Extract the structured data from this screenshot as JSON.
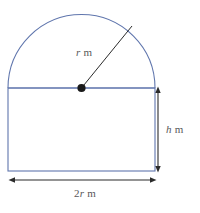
{
  "figure": {
    "name": "semicircle-on-rectangle-diagram",
    "background_color": "#ffffff",
    "outline_color": "#6076ad",
    "annotation_color": "#3a3a3a",
    "label_color": "#58585a",
    "labels": {
      "radius": {
        "symbol": "r",
        "unit": "m",
        "text": "r m"
      },
      "height": {
        "symbol": "h",
        "unit": "m",
        "text": "h m"
      },
      "width": {
        "symbol": "2r",
        "unit": "m",
        "text": "2r m",
        "coefficient": "2"
      }
    },
    "geometry": {
      "rectangle": {
        "x": 8,
        "y": 88,
        "width": 147,
        "height": 83
      },
      "semicircle": {
        "center_x": 81.5,
        "center_y": 88,
        "radius": 73.5
      },
      "center_dot": {
        "x": 81.5,
        "y": 88,
        "radius": 4
      },
      "radius_line": {
        "x1": 81.5,
        "y1": 88,
        "x2": 132,
        "y2": 26
      },
      "height_arrow": {
        "x": 158,
        "y1": 88,
        "y2": 171
      },
      "width_arrow": {
        "y": 180,
        "x1": 10,
        "x2": 155
      }
    }
  }
}
